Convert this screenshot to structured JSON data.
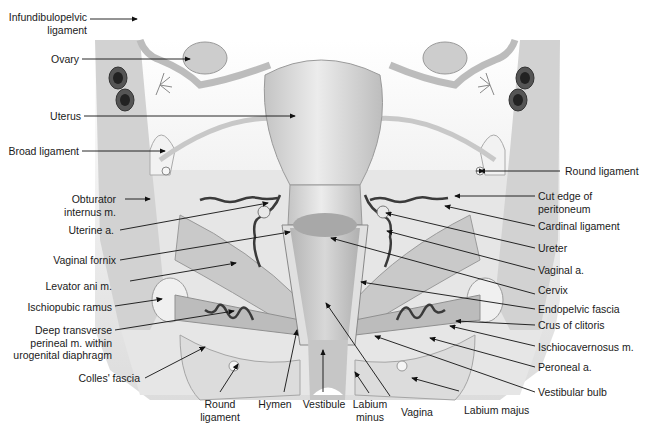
{
  "figure": {
    "colors": {
      "background": "#ffffff",
      "tissue_light": "#e2e2e2",
      "tissue_mid": "#cfcfcf",
      "tissue_dark": "#9a9a9a",
      "vessel": "#3a3a3a",
      "line": "#111111",
      "text": "#1a1a1a"
    }
  },
  "labels": {
    "left": [
      {
        "id": "infundibulopelvic_ligament",
        "text": "Infundibulopelvic\nligament"
      },
      {
        "id": "ovary",
        "text": "Ovary"
      },
      {
        "id": "uterus",
        "text": "Uterus"
      },
      {
        "id": "broad_ligament",
        "text": "Broad ligament"
      },
      {
        "id": "obturator_internus",
        "text": "Obturator\ninternus m."
      },
      {
        "id": "uterine_a",
        "text": "Uterine a."
      },
      {
        "id": "vaginal_fornix",
        "text": "Vaginal fornix"
      },
      {
        "id": "levator_ani",
        "text": "Levator ani m."
      },
      {
        "id": "ischiopubic_ramus",
        "text": "Ischiopubic ramus"
      },
      {
        "id": "deep_transverse_perineal",
        "text": "Deep transverse\nperineal m. within\nurogenital diaphragm"
      },
      {
        "id": "colles_fascia",
        "text": "Colles' fascia"
      }
    ],
    "right": [
      {
        "id": "round_ligament_r",
        "text": "Round ligament"
      },
      {
        "id": "cut_edge_peritoneum",
        "text": "Cut edge of\nperitoneum"
      },
      {
        "id": "cardinal_ligament",
        "text": "Cardinal ligament"
      },
      {
        "id": "ureter",
        "text": "Ureter"
      },
      {
        "id": "vaginal_a",
        "text": "Vaginal a."
      },
      {
        "id": "cervix",
        "text": "Cervix"
      },
      {
        "id": "endopelvic_fascia",
        "text": "Endopelvic fascia"
      },
      {
        "id": "crus_of_clitoris",
        "text": "Crus of clitoris"
      },
      {
        "id": "ischiocavernosus",
        "text": "Ischiocavernosus m."
      },
      {
        "id": "peroneal_a",
        "text": "Peroneal a."
      },
      {
        "id": "vestibular_bulb",
        "text": "Vestibular bulb"
      }
    ],
    "bottom": [
      {
        "id": "round_ligament_b",
        "text": "Round\nligament"
      },
      {
        "id": "hymen",
        "text": "Hymen"
      },
      {
        "id": "vestibule",
        "text": "Vestibule"
      },
      {
        "id": "labium_minus",
        "text": "Labium\nminus"
      },
      {
        "id": "vagina",
        "text": "Vagina"
      },
      {
        "id": "labium_majus",
        "text": "Labium majus"
      }
    ]
  }
}
